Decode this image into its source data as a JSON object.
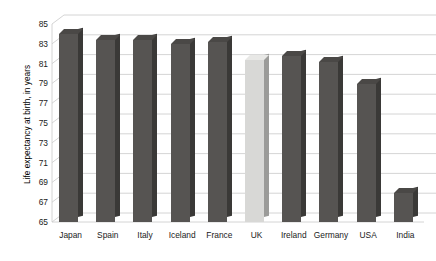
{
  "chart_data": {
    "type": "bar",
    "title": "",
    "subtitle": "",
    "xlabel": "",
    "ylabel": "Life expectancy at birth, in years",
    "categories": [
      "Japan",
      "Spain",
      "Italy",
      "Iceland",
      "France",
      "UK",
      "Ireland",
      "Germany",
      "USA",
      "India"
    ],
    "values": [
      84.0,
      83.4,
      83.4,
      83.0,
      83.2,
      81.4,
      81.8,
      81.2,
      78.9,
      67.9
    ],
    "ylim": [
      65,
      85
    ],
    "ytick_labels": [
      "85",
      "83",
      "81",
      "79",
      "77",
      "75",
      "73",
      "71",
      "69",
      "67",
      "65"
    ],
    "ytick_values": [
      85,
      83,
      81,
      79,
      77,
      75,
      73,
      71,
      69,
      67,
      65
    ],
    "ytick_step": 2,
    "grid": true,
    "grid_axis": "y",
    "legend": false,
    "legend_position": "none",
    "bar_colors": [
      "#565452",
      "#565452",
      "#565452",
      "#565452",
      "#565452",
      "#d8d8d6",
      "#565452",
      "#565452",
      "#565452",
      "#565452"
    ],
    "highlight_category": "UK",
    "style": "3d-column",
    "background_color": "#ffffff",
    "grid_color": "#c9c9c9",
    "text_color": "#1a1a1a"
  }
}
